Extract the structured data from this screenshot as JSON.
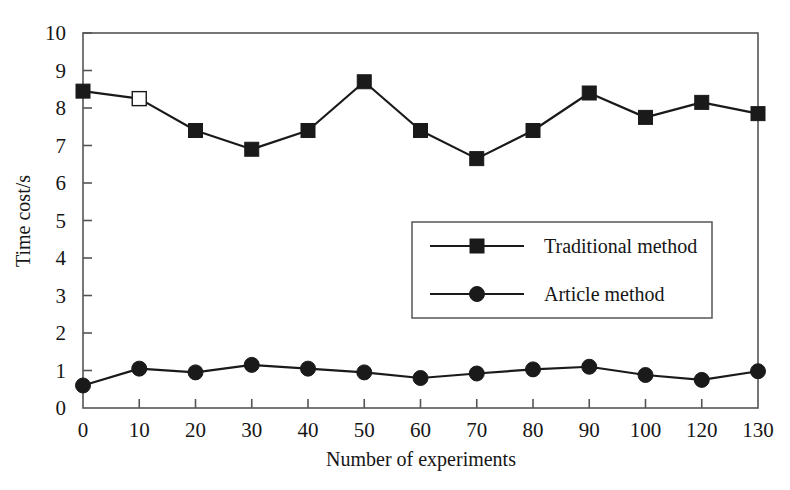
{
  "chart_data": {
    "type": "line",
    "title": "",
    "subtitle": "",
    "xlabel": "Number of experiments",
    "ylabel": "Time cost/s",
    "categories": [
      "0",
      "10",
      "20",
      "30",
      "40",
      "50",
      "60",
      "70",
      "80",
      "90",
      "100",
      "120",
      "130"
    ],
    "x_tick_labels": [
      "0",
      "10",
      "20",
      "30",
      "40",
      "50",
      "60",
      "70",
      "80",
      "90",
      "100",
      "120",
      "130"
    ],
    "y_tick_labels": [
      "0",
      "1",
      "2",
      "3",
      "4",
      "5",
      "6",
      "7",
      "8",
      "9",
      "10"
    ],
    "ylim": [
      0,
      10
    ],
    "y_major_step": 1,
    "grid": false,
    "legend_position": "inside-center-right",
    "series": [
      {
        "name": "Traditional method",
        "marker": "filled-square",
        "color": "#1a1a1a",
        "values": [
          8.45,
          8.25,
          7.4,
          6.9,
          7.4,
          8.7,
          7.4,
          6.65,
          7.4,
          8.4,
          7.75,
          8.15,
          7.85
        ]
      },
      {
        "name": "Article method",
        "marker": "filled-circle",
        "color": "#1a1a1a",
        "values": [
          0.6,
          1.05,
          0.95,
          1.15,
          1.05,
          0.95,
          0.8,
          0.92,
          1.03,
          1.1,
          0.88,
          0.75,
          0.98
        ]
      }
    ],
    "annotations": [
      {
        "type": "open-marker",
        "series": "Traditional method",
        "category": "10",
        "note": "marker rendered hollow"
      }
    ]
  },
  "axes": {
    "y_title": "Time cost/s",
    "x_title": "Number of experiments"
  },
  "legend": {
    "entries": [
      {
        "label": "Traditional method",
        "marker": "filled-square"
      },
      {
        "label": "Article method",
        "marker": "filled-circle"
      }
    ]
  },
  "colors": {
    "line": "#1a1a1a",
    "frame": "#555555",
    "text": "#161616",
    "background": "#ffffff"
  }
}
